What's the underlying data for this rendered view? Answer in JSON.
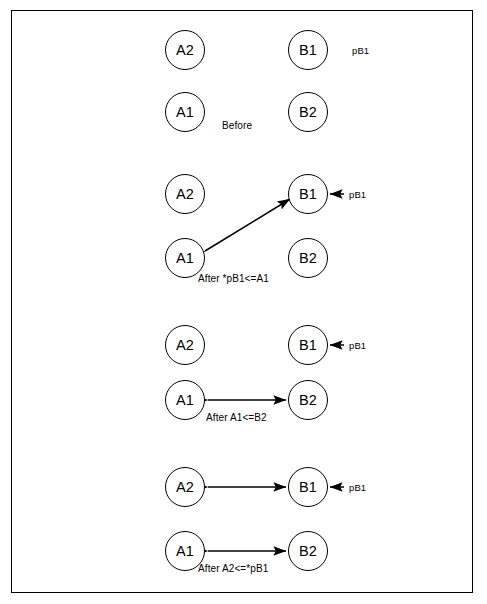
{
  "figure": {
    "border_color": "#000000",
    "line_color": "#000000",
    "background": "#ffffff"
  },
  "panels": [
    {
      "id": "panel-before",
      "caption": "Before",
      "nodes": [
        {
          "id": "p1-a2",
          "label": "A2"
        },
        {
          "id": "p1-b1",
          "label": "B1"
        },
        {
          "id": "p1-a1",
          "label": "A1"
        },
        {
          "id": "p1-b2",
          "label": "B2"
        }
      ],
      "pointer_label": "pB1"
    },
    {
      "id": "panel-step1",
      "caption": "After *pB1<=A1",
      "nodes": [
        {
          "id": "p2-a2",
          "label": "A2"
        },
        {
          "id": "p2-b1",
          "label": "B1"
        },
        {
          "id": "p2-a1",
          "label": "A1"
        },
        {
          "id": "p2-b2",
          "label": "B2"
        }
      ],
      "pointer_label": "pB1"
    },
    {
      "id": "panel-step2",
      "caption": "After A1<=B2",
      "nodes": [
        {
          "id": "p3-a2",
          "label": "A2"
        },
        {
          "id": "p3-b1",
          "label": "B1"
        },
        {
          "id": "p3-a1",
          "label": "A1"
        },
        {
          "id": "p3-b2",
          "label": "B2"
        }
      ],
      "pointer_label": "pB1"
    },
    {
      "id": "panel-step3",
      "caption": "After A2<=*pB1",
      "nodes": [
        {
          "id": "p4-a2",
          "label": "A2"
        },
        {
          "id": "p4-b1",
          "label": "B1"
        },
        {
          "id": "p4-a1",
          "label": "A1"
        },
        {
          "id": "p4-b2",
          "label": "B2"
        }
      ],
      "pointer_label": "pB1"
    }
  ]
}
